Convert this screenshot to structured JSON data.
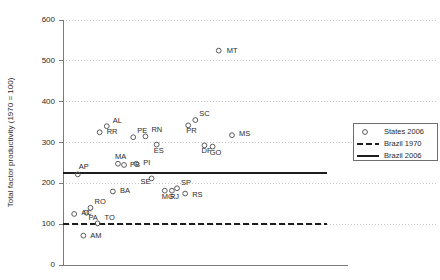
{
  "chart_data": {
    "type": "scatter",
    "title": "",
    "xlabel": "",
    "ylabel": "Total factor productivity (1970 = 100)",
    "ylim": [
      0,
      600
    ],
    "yticks": [
      0,
      100,
      200,
      300,
      400,
      500,
      600
    ],
    "ytick_labels": [
      "0",
      "100",
      "200",
      "300",
      "400",
      "500",
      "600"
    ],
    "xlim": [
      0,
      28
    ],
    "xticks": [],
    "xtick_labels": [],
    "grid": "horizontal-dotted",
    "legend_position": "right-middle",
    "series": [
      {
        "name": "States 2006",
        "type": "scatter",
        "marker": "open-circle",
        "points": [
          {
            "label": "AC",
            "x": 1.1,
            "y": 125
          },
          {
            "label": "AM",
            "x": 2.0,
            "y": 72
          },
          {
            "label": "AP",
            "x": 1.45,
            "y": 222
          },
          {
            "label": "PA",
            "x": 2.3,
            "y": 128
          },
          {
            "label": "RO",
            "x": 2.7,
            "y": 140
          },
          {
            "label": "RR",
            "x": 3.6,
            "y": 325
          },
          {
            "label": "TO",
            "x": 3.4,
            "y": 102
          },
          {
            "label": "AL",
            "x": 4.3,
            "y": 340
          },
          {
            "label": "BA",
            "x": 4.9,
            "y": 180
          },
          {
            "label": "MA",
            "x": 5.4,
            "y": 248
          },
          {
            "label": "PB",
            "x": 6.0,
            "y": 245
          },
          {
            "label": "PE",
            "x": 6.9,
            "y": 313
          },
          {
            "label": "PI",
            "x": 7.2,
            "y": 248
          },
          {
            "label": "RN",
            "x": 8.1,
            "y": 315
          },
          {
            "label": "SE",
            "x": 8.7,
            "y": 212
          },
          {
            "label": "ES",
            "x": 9.2,
            "y": 295
          },
          {
            "label": "MG",
            "x": 10.0,
            "y": 182
          },
          {
            "label": "RJ",
            "x": 10.7,
            "y": 182
          },
          {
            "label": "SP",
            "x": 11.2,
            "y": 188
          },
          {
            "label": "PR",
            "x": 12.3,
            "y": 342
          },
          {
            "label": "RS",
            "x": 12.0,
            "y": 175
          },
          {
            "label": "SC",
            "x": 13.0,
            "y": 355
          },
          {
            "label": "DF",
            "x": 13.9,
            "y": 293
          },
          {
            "label": "GO",
            "x": 14.7,
            "y": 290
          },
          {
            "label": "MT",
            "x": 15.3,
            "y": 525
          },
          {
            "label": "MS",
            "x": 16.6,
            "y": 318
          }
        ]
      },
      {
        "name": "Brazil 1970",
        "type": "line",
        "style": "dashed",
        "value": 100
      },
      {
        "name": "Brazil 2006",
        "type": "line",
        "style": "solid",
        "value": 225
      }
    ],
    "legend": [
      {
        "label": "States 2006",
        "marker": "open-circle"
      },
      {
        "label": "Brazil 1970",
        "marker": "dashed-line"
      },
      {
        "label": "Brazil 2006",
        "marker": "solid-line"
      }
    ]
  }
}
